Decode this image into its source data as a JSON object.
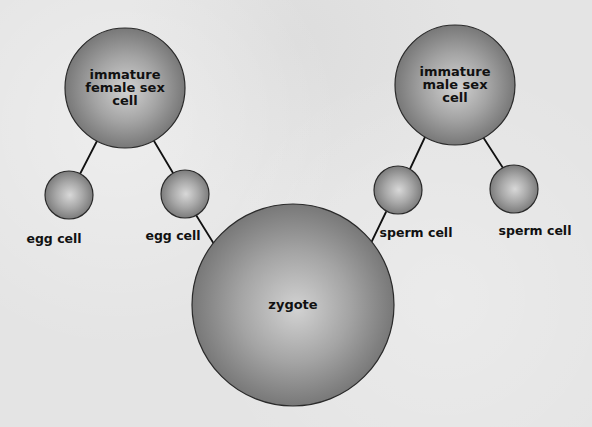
{
  "diagram": {
    "type": "fertilization-diagram",
    "colors": {
      "background": "#e4e4e4",
      "cell_edge": "#7a7a7a",
      "cell_highlight": "#cfcfcf",
      "cell_outline": "#2a2a2a",
      "connector": "#111111",
      "label": "#111111"
    },
    "nodes": [
      {
        "id": "immature_female",
        "label_lines": [
          "immature",
          "female sex",
          "cell"
        ],
        "cx": 125,
        "cy": 88,
        "r": 60
      },
      {
        "id": "immature_male",
        "label_lines": [
          "immature",
          "male sex",
          "cell"
        ],
        "cx": 455,
        "cy": 85,
        "r": 60
      },
      {
        "id": "egg1",
        "label": "egg cell",
        "cx": 69,
        "cy": 195,
        "r": 24,
        "label_x": 54,
        "label_y": 243
      },
      {
        "id": "egg2",
        "label": "egg cell",
        "cx": 185,
        "cy": 194,
        "r": 24,
        "label_x": 173,
        "label_y": 240
      },
      {
        "id": "sperm1",
        "label": "sperm cell",
        "cx": 398,
        "cy": 190,
        "r": 24,
        "label_x": 416,
        "label_y": 237
      },
      {
        "id": "sperm2",
        "label": "sperm cell",
        "cx": 514,
        "cy": 189,
        "r": 24,
        "label_x": 535,
        "label_y": 235
      },
      {
        "id": "zygote",
        "label": "zygote",
        "cx": 293,
        "cy": 305,
        "r": 101
      }
    ],
    "edges": [
      {
        "from": "immature_female",
        "to": "egg1",
        "x1": 97,
        "y1": 141,
        "x2": 80,
        "y2": 174
      },
      {
        "from": "immature_female",
        "to": "egg2",
        "x1": 154,
        "y1": 141,
        "x2": 173,
        "y2": 173
      },
      {
        "from": "immature_male",
        "to": "sperm1",
        "x1": 425,
        "y1": 137,
        "x2": 410,
        "y2": 169
      },
      {
        "from": "immature_male",
        "to": "sperm2",
        "x1": 483,
        "y1": 137,
        "x2": 503,
        "y2": 168
      },
      {
        "from": "egg2",
        "to": "zygote",
        "x1": 196,
        "y1": 215,
        "x2": 214,
        "y2": 244
      },
      {
        "from": "sperm1",
        "to": "zygote",
        "x1": 386,
        "y1": 212,
        "x2": 371,
        "y2": 243
      }
    ]
  },
  "labels": {
    "immature_female": [
      "immature",
      "female sex",
      "cell"
    ],
    "immature_male": [
      "immature",
      "male sex",
      "cell"
    ],
    "egg1": "egg cell",
    "egg2": "egg cell",
    "sperm1": "sperm cell",
    "sperm2": "sperm cell",
    "zygote": "zygote"
  }
}
